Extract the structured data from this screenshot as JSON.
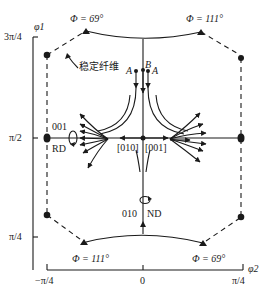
{
  "diagram": {
    "type": "orientation-flow-field",
    "axes": {
      "y_label": "φ1",
      "y_ticks": [
        "3π/4",
        "π/2",
        "π/4"
      ],
      "x_label": "φ2",
      "x_ticks": [
        "−π/4",
        "0",
        "π/4"
      ]
    },
    "phi_labels": {
      "top_left": "Φ = 69°",
      "top_right": "Φ = 111°",
      "bottom_left": "Φ = 111°",
      "bottom_right": "Φ = 69°"
    },
    "annotation_stable_fiber": "稳定纤维",
    "points": {
      "a_left": "A",
      "b": "B",
      "a_right": "A"
    },
    "center_labels": {
      "left": "[010]",
      "right": "[001]"
    },
    "rd_labels": {
      "axis": "001",
      "dir": "RD"
    },
    "nd_labels": {
      "axis": "010",
      "dir": "ND"
    },
    "colors": {
      "ink": "#1a1a1a",
      "background": "#ffffff"
    }
  }
}
